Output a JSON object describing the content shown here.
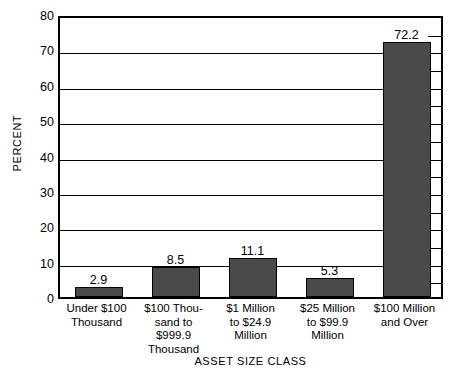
{
  "chart_data": {
    "type": "bar",
    "title": "",
    "xlabel": "ASSET SIZE CLASS",
    "ylabel": "PERCENT",
    "categories": [
      "Under $100\nThousand",
      "$100 Thou-\nsand to\n$999.9\nThousand",
      "$1 Million\nto $24.9\nMillion",
      "$25 Million\nto $99.9\nMillion",
      "$100 Million\nand Over"
    ],
    "values": [
      2.9,
      8.5,
      11.1,
      5.3,
      72.2
    ],
    "value_labels": [
      "2.9",
      "8.5",
      "11.1",
      "5.3",
      "72.2"
    ],
    "ylim": [
      0,
      80
    ],
    "ytick_labels": [
      "0",
      "10",
      "20",
      "30",
      "40",
      "50",
      "60",
      "70",
      "80"
    ],
    "ytick_values": [
      0,
      10,
      20,
      30,
      40,
      50,
      60,
      70,
      80
    ],
    "minor_tick_values": [
      5,
      15,
      25,
      35,
      45,
      55,
      65,
      75
    ],
    "grid": true,
    "legend": "none",
    "bar_color": "#4a4a4a",
    "bar_edge_color": "#000000",
    "background_color": "#ffffff"
  }
}
